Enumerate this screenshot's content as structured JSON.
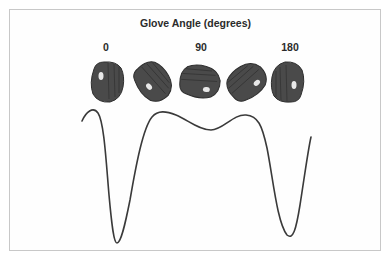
{
  "diagram": {
    "title": "Glove Angle (degrees)",
    "angle_labels": [
      {
        "text": "0",
        "x": 106
      },
      {
        "text": "90",
        "x": 201
      },
      {
        "text": "180",
        "x": 290
      }
    ],
    "gloves": [
      {
        "name": "glove-0-deg",
        "rotation": 0,
        "x": 87
      },
      {
        "name": "glove-45-deg",
        "rotation": -40,
        "x": 133
      },
      {
        "name": "glove-90-deg",
        "rotation": -85,
        "x": 180
      },
      {
        "name": "glove-135-deg",
        "rotation": -130,
        "x": 227
      },
      {
        "name": "glove-180-deg",
        "rotation": 180,
        "x": 268
      }
    ],
    "curve": {
      "color": "#3a3a3a",
      "description": "Response curve vs glove angle: peak near 0, deep minimum, broad plateau with dip at 90, deep minimum, rising toward 180"
    },
    "colors": {
      "glove_fill": "#4a4a4a",
      "glove_dark": "#2e2e2e",
      "frame_border": "#c8c8c8",
      "text": "#2b2b2b"
    }
  }
}
